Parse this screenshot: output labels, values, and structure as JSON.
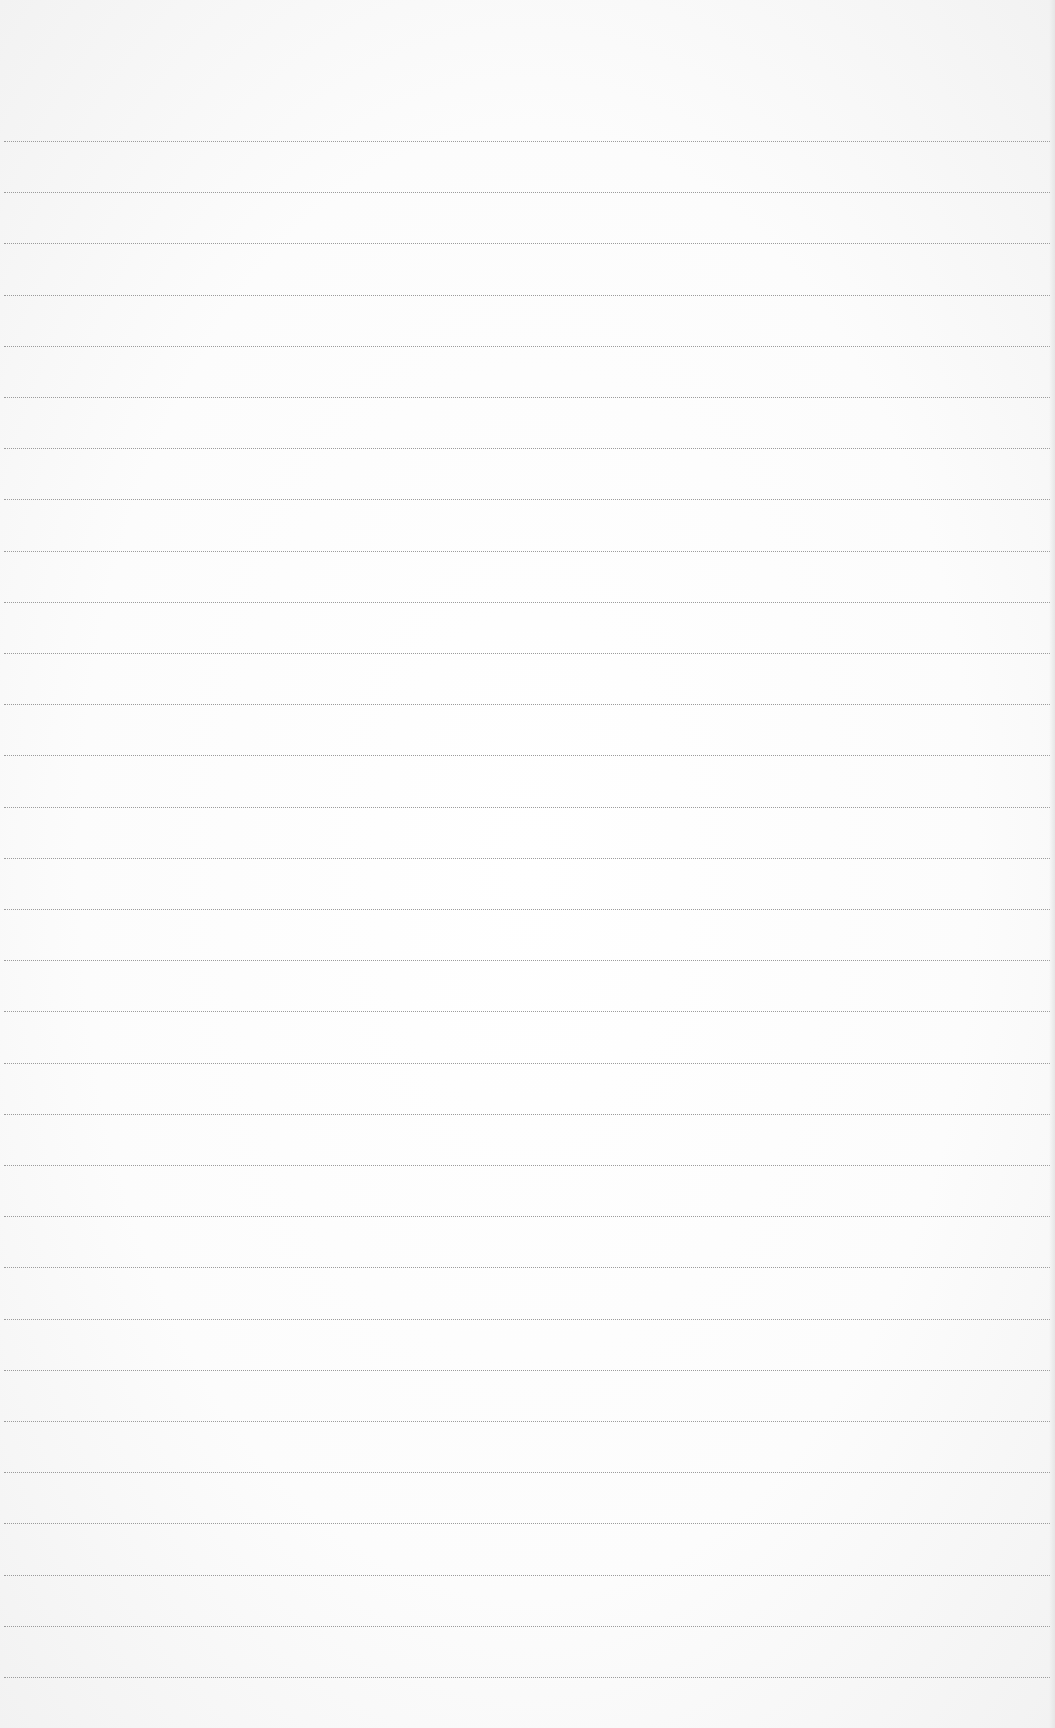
{
  "document": {
    "type": "blank ruled paper",
    "line_count": 31,
    "first_line_y": 141,
    "line_spacing": 51.2,
    "line_color": "#8c8c8c",
    "paper_color": "#fbfbfb",
    "text": ""
  }
}
